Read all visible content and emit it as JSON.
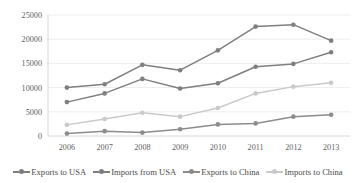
{
  "chart_data": {
    "type": "line",
    "title": "",
    "xlabel": "",
    "ylabel": "",
    "categories": [
      "2006",
      "2007",
      "2008",
      "2009",
      "2010",
      "2011",
      "2012",
      "2013"
    ],
    "ylim": [
      0,
      25000
    ],
    "yticks": [
      "0",
      "5000",
      "10000",
      "15000",
      "20000",
      "25000"
    ],
    "ytick_values": [
      0,
      5000,
      10000,
      15000,
      20000,
      25000
    ],
    "grid": true,
    "legend_position": "bottom",
    "series": [
      {
        "name": "Exports to USA",
        "color": "#7f7f7f",
        "values": [
          10000,
          10700,
          14700,
          13600,
          17700,
          22600,
          23000,
          19700
        ]
      },
      {
        "name": "Imports from USA",
        "color": "#7f7f7f",
        "values": [
          7000,
          8800,
          11800,
          9800,
          10900,
          14300,
          14900,
          17300
        ]
      },
      {
        "name": "Exports to China",
        "color": "#8c8c8c",
        "values": [
          500,
          1000,
          700,
          1400,
          2400,
          2600,
          4000,
          4400
        ]
      },
      {
        "name": "Imports to China",
        "color": "#c9c9c9",
        "values": [
          2300,
          3500,
          4800,
          4000,
          5800,
          8800,
          10200,
          11000
        ]
      }
    ]
  },
  "legend": {
    "items": [
      {
        "label": "Exports to USA"
      },
      {
        "label": "Imports from USA"
      },
      {
        "label": "Exports to China"
      },
      {
        "label": "Imports to China"
      }
    ]
  },
  "colors": {
    "gridline": "#e9e9e9",
    "axis": "#d4d4d4",
    "tick_text": "#5f5f5f",
    "legend_text": "#4a4a4a",
    "background": "#ffffff"
  }
}
